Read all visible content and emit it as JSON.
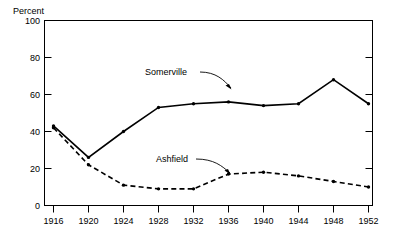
{
  "chart_data": {
    "type": "line",
    "title": "",
    "subtitle": "",
    "xlabel": "",
    "ylabel": "Percent",
    "ylim": [
      0,
      100
    ],
    "yticks": [
      0,
      20,
      40,
      60,
      80,
      100
    ],
    "ytick_labels": [
      "0",
      "20",
      "40",
      "60",
      "80",
      "100"
    ],
    "x": [
      1916,
      1920,
      1924,
      1928,
      1932,
      1936,
      1940,
      1944,
      1948,
      1952
    ],
    "xtick_labels": [
      "1916",
      "1920",
      "1924",
      "1928",
      "1932",
      "1936",
      "1940",
      "1944",
      "1948",
      "1952"
    ],
    "grid": false,
    "legend_position": "inline-annotations",
    "series": [
      {
        "name": "Somerville",
        "style": "solid",
        "values": [
          43,
          26,
          40,
          53,
          55,
          56,
          54,
          55,
          68,
          55
        ]
      },
      {
        "name": "Ashfield",
        "style": "dashed",
        "values": [
          42,
          22,
          11,
          9,
          9,
          17,
          18,
          16,
          13,
          10
        ]
      }
    ],
    "annotations": [
      {
        "text": "Somerville",
        "for_series": "Somerville"
      },
      {
        "text": "Ashfield",
        "for_series": "Ashfield"
      }
    ],
    "colors": {
      "line": "#000000",
      "axis": "#000000",
      "background": "#ffffff"
    }
  },
  "axis": {
    "y_title": "Percent"
  }
}
